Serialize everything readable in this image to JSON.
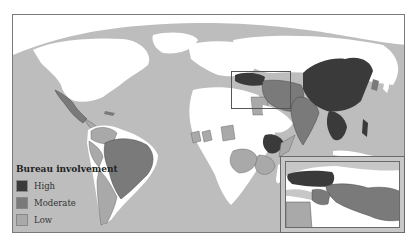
{
  "map": {
    "ocean_color": "#bdbdbd",
    "land_color": "#ffffff",
    "colors": {
      "high": "#3a3a3a",
      "moderate": "#7a7a7a",
      "low": "#a9a9a9"
    }
  },
  "legend": {
    "title": "Bureau involvement",
    "items": [
      {
        "key": "high",
        "label": "High",
        "color": "#3a3a3a"
      },
      {
        "key": "moderate",
        "label": "Moderate",
        "color": "#7a7a7a"
      },
      {
        "key": "low",
        "label": "Low",
        "color": "#a9a9a9"
      }
    ]
  },
  "regions": {
    "high": [
      "China",
      "Turkey",
      "Ethiopia",
      "Southeast Asia (Indochina)",
      "Philippines"
    ],
    "moderate": [
      "Brazil",
      "India",
      "Iran",
      "Iraq",
      "Mexico",
      "Afghanistan",
      "Pakistan"
    ],
    "low": [
      "Colombia",
      "Venezuela",
      "Peru",
      "Argentina",
      "Chile",
      "Egypt",
      "Nigeria",
      "Ghana",
      "DR Congo",
      "Kenya",
      "Tanzania",
      "Uganda",
      "Central America"
    ]
  },
  "inset": {
    "label": "Middle East inset"
  }
}
